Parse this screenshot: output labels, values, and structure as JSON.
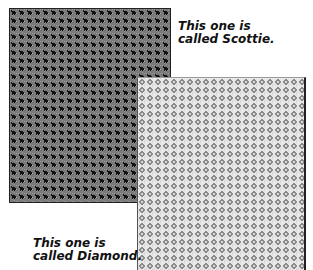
{
  "swatches": {
    "scottie": {
      "name": "Scottie",
      "caption_line1": "This one is",
      "caption_line2": "called Scottie.",
      "background_color": "#7a7a7a",
      "motif_color": "#111111",
      "tile_size_px": 8
    },
    "diamond": {
      "name": "Diamond",
      "caption_line1": "This one is",
      "caption_line2": "called Diamond.",
      "background_color": "#e6e6e6",
      "motif_color": "#8a8a8a",
      "motif_center_color": "#d4d4d4",
      "tile_size_px": 8
    }
  }
}
